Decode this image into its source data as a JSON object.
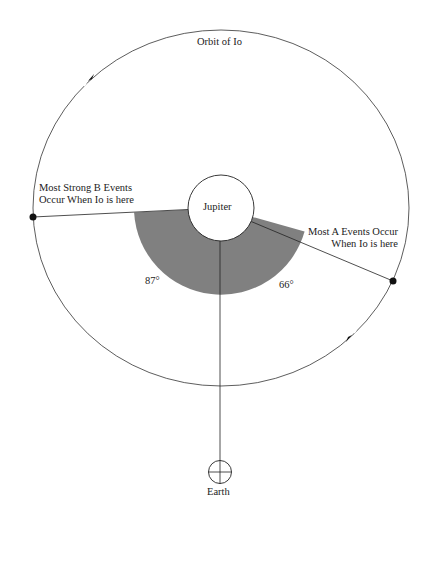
{
  "diagram": {
    "orbit_label": "Orbit of Io",
    "planet_label": "Jupiter",
    "earth_label": "Earth",
    "b_events_label": [
      "Most Strong B Events",
      "Occur When Io is here"
    ],
    "a_events_label": [
      "Most A Events Occur",
      "When Io is here"
    ],
    "angle_b": "87°",
    "angle_a": "66°",
    "colors": {
      "line": "#222222",
      "sector_fill": "#808080",
      "background": "#ffffff"
    }
  }
}
